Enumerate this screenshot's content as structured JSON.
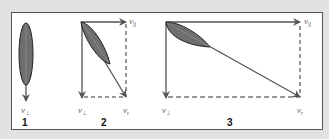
{
  "diagram": {
    "colors": {
      "background": "#e2e2e2",
      "panel": "#ffffff",
      "frame": "#555555",
      "leaf_fill": "#6e6e6e",
      "leaf_outline": "#222222",
      "arrow": "#555555"
    },
    "panels": [
      {
        "number": "1",
        "labels": {
          "perp": "v",
          "perp_sub": "⊥"
        }
      },
      {
        "number": "2",
        "labels": {
          "par": "v",
          "par_sub": "||",
          "perp": "v",
          "perp_sub": "⊥",
          "res": "v",
          "res_sub": "r"
        }
      },
      {
        "number": "3",
        "labels": {
          "par": "v",
          "par_sub": "||",
          "perp": "v",
          "perp_sub": "⊥",
          "res": "v",
          "res_sub": "r"
        }
      }
    ]
  }
}
